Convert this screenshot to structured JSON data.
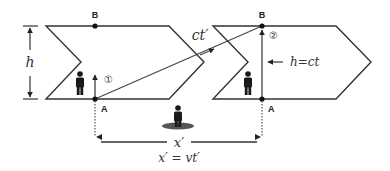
{
  "diagram": {
    "colors": {
      "line": "#333333",
      "shadow": "#555555",
      "figure": "#1a1a1a"
    },
    "points": {
      "b_left": "B",
      "a_left": "A",
      "b_right": "B",
      "a_right": "A"
    },
    "markers": {
      "step1": "①",
      "step2": "②"
    },
    "labels": {
      "height": "h",
      "light_path": "ct′",
      "height_eq": "h=ct",
      "displacement": "x′",
      "displacement_eq": "x′ = vt′"
    },
    "figures": [
      {
        "name": "observer-in-left-frame"
      },
      {
        "name": "observer-in-right-frame"
      },
      {
        "name": "stationary-observer"
      }
    ]
  }
}
